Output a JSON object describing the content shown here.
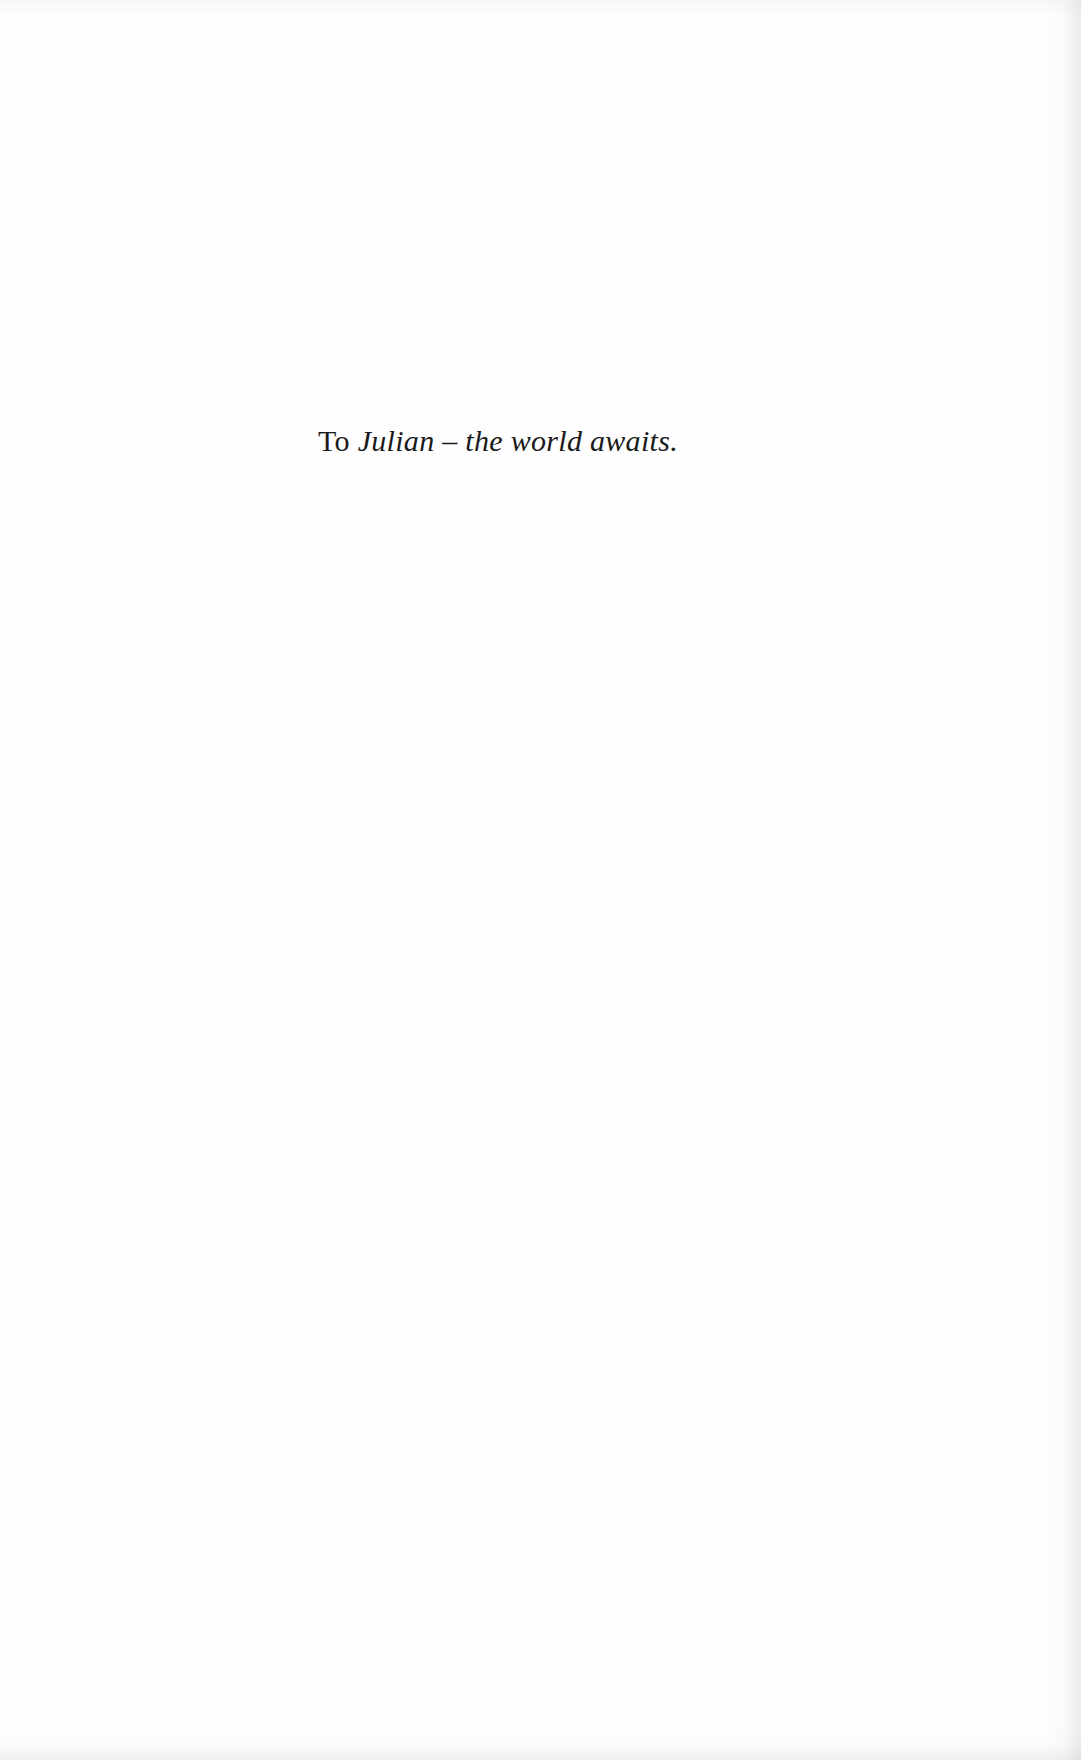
{
  "page": {
    "type": "dedication",
    "background_color": "#fefefe",
    "text_color": "#1a1a1a"
  },
  "dedication": {
    "lead": "To",
    "text": "Julian – the world awaits."
  }
}
